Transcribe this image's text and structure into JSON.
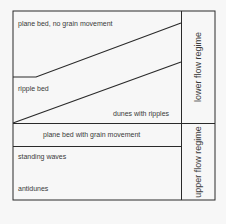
{
  "diagram": {
    "type": "bedform-regime-diagram",
    "line_color": "#2a2a2a",
    "background": "#f7f7f7",
    "regimes": [
      {
        "label": "lower flow regime",
        "bedforms": [
          {
            "label": "plane bed, no grain movement"
          },
          {
            "label": "ripple bed"
          },
          {
            "label": "dunes with ripples"
          }
        ]
      },
      {
        "label": "upper flow regime",
        "bedforms": [
          {
            "label": "plane bed with grain movement"
          },
          {
            "label": "standing waves"
          },
          {
            "label": "antidunes"
          }
        ]
      }
    ]
  }
}
